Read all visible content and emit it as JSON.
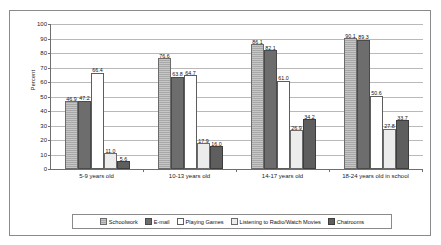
{
  "chart_data": {
    "type": "bar",
    "title": "",
    "xlabel": "",
    "ylabel": "Percent",
    "ylim": [
      0,
      100
    ],
    "ytick_step": 10,
    "ytick_labels": [
      "0",
      "10",
      "20",
      "30",
      "40",
      "50",
      "60",
      "70",
      "80",
      "90",
      "100"
    ],
    "grid": true,
    "legend_position": "bottom",
    "categories": [
      "5-9 years old",
      "10-13 years old",
      "14-17 years old",
      "18-24 years old in school"
    ],
    "series": [
      {
        "name": "Schoolwork",
        "color": "#a8a8a8",
        "values": [
          46.9,
          76.6,
          86.1,
          90.1
        ],
        "labels": [
          "46.9",
          "76.6",
          "86.1",
          "90.1"
        ]
      },
      {
        "name": "E-mail",
        "color": "#6d6d6d",
        "values": [
          47.2,
          63.8,
          82.1,
          89.3
        ],
        "labels": [
          "47.2",
          "63.8",
          "82.1",
          "89.3"
        ]
      },
      {
        "name": "Playing Games",
        "color": "#ffffff",
        "values": [
          66.4,
          64.7,
          61.0,
          50.6
        ],
        "labels": [
          "66.4",
          "64.7",
          "61.0",
          "50.6"
        ]
      },
      {
        "name": "Listening to Radio/Watch Movies",
        "color": "#ececed",
        "values": [
          11.0,
          17.9,
          26.9,
          27.8
        ],
        "labels": [
          "11.0",
          "17.9",
          "26.9",
          "27.8"
        ]
      },
      {
        "name": "Chatrooms",
        "color": "#5e5e5e",
        "values": [
          5.6,
          16.0,
          34.2,
          33.7
        ],
        "labels": [
          "5.6",
          "16.0",
          "34.2",
          "33.7"
        ]
      }
    ]
  }
}
